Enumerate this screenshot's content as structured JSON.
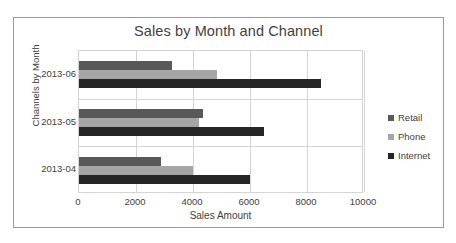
{
  "chart_data": {
    "type": "bar",
    "orientation": "horizontal",
    "title": "Sales by Month and Channel",
    "xlabel": "Sales Amount",
    "ylabel": "Channels by Month",
    "categories": [
      "2013-06",
      "2013-05",
      "2013-04"
    ],
    "series": [
      {
        "name": "Retail",
        "color": "#595959",
        "values": [
          3270,
          4350,
          2880
        ]
      },
      {
        "name": "Phone",
        "color": "#a6a6a6",
        "values": [
          4850,
          4200,
          4000
        ]
      },
      {
        "name": "Internet",
        "color": "#262626",
        "values": [
          8500,
          6500,
          6000
        ]
      }
    ],
    "xlim": [
      0,
      10000
    ],
    "xticks": [
      0,
      2000,
      4000,
      6000,
      8000,
      10000
    ],
    "xtick_labels": [
      "0",
      "2000",
      "4000",
      "6000",
      "8000",
      "10000"
    ],
    "grid": "vertical",
    "legend_position": "right",
    "plot_background": "#ffffff",
    "grid_color": "#d4d4d4",
    "border_color": "#9a9a9a"
  }
}
